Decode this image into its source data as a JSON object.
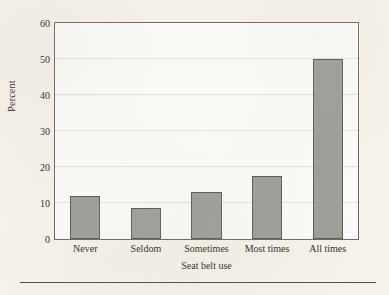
{
  "chart_data": {
    "type": "bar",
    "title": "",
    "categories": [
      "Never",
      "Seldom",
      "Sometimes",
      "Most times",
      "All times"
    ],
    "values": [
      12,
      8.5,
      13,
      17.5,
      50
    ],
    "xlabel": "Seat belt use",
    "ylabel": "Percent",
    "ylim": [
      0,
      60
    ],
    "ytick_labels": [
      "0",
      "10",
      "20",
      "30",
      "40",
      "50",
      "60"
    ],
    "ytick_values": [
      0,
      10,
      20,
      30,
      40,
      50,
      60
    ],
    "yminor_tick_values": [
      5,
      15,
      25,
      35,
      45,
      55
    ],
    "grid": true,
    "legend": false,
    "legend_position": "none",
    "bar_color": "#9e9e9a",
    "bar_edge_color": "#5e5a54",
    "axis_color": "#6e6a62",
    "grid_color": "#e6e2da",
    "plot_background": "#fdfcfa",
    "page_background": "#f6f3ec"
  }
}
